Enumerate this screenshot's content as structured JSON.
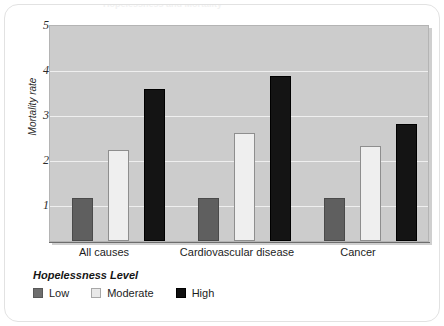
{
  "card": {
    "title_sliver": "Hopelessness and Mortality"
  },
  "chart_data": {
    "type": "bar",
    "title": "",
    "xlabel": "",
    "ylabel": "Mortality rate",
    "categories": [
      "All causes",
      "Cardiovascular disease",
      "Cancer"
    ],
    "series": [
      {
        "name": "Low",
        "color": "#5f5f5f",
        "values": [
          1.0,
          1.0,
          1.0
        ]
      },
      {
        "name": "Moderate",
        "color": "#efefef",
        "values": [
          2.1,
          2.5,
          2.2
        ]
      },
      {
        "name": "High",
        "color": "#141414",
        "values": [
          3.5,
          3.8,
          2.7
        ]
      }
    ],
    "ylim": [
      0,
      5
    ],
    "yticks": [
      1,
      2,
      3,
      4,
      5
    ],
    "ytick_labels": [
      "1",
      "2",
      "3",
      "4",
      "5"
    ],
    "grid": true,
    "legend_position": "below",
    "legend_title": "Hopelessness Level",
    "plot_background": "#cccccc",
    "gridline_color": "#efefef"
  },
  "legend": {
    "title": "Hopelessness Level",
    "items": [
      {
        "label": "Low"
      },
      {
        "label": "Moderate"
      },
      {
        "label": "High"
      }
    ]
  },
  "axis": {
    "y_label": "Mortality rate",
    "y_ticks": [
      "5",
      "4",
      "3",
      "2",
      "1"
    ],
    "x_ticks": [
      "All causes",
      "Cardiovascular disease",
      "Cancer"
    ]
  }
}
